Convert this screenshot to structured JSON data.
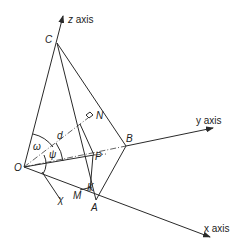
{
  "diagram": {
    "type": "3d-geometry-tetrahedron",
    "axes": {
      "z": {
        "label": "z axis"
      },
      "y": {
        "label": "y axis"
      },
      "x": {
        "label": "x axis"
      }
    },
    "points": {
      "O": "O",
      "A": "A",
      "B": "B",
      "C": "C",
      "N": "N",
      "P": "P",
      "K": "K",
      "M": "M"
    },
    "symbols": {
      "omega": "ω",
      "psi": "ψ",
      "chi": "χ",
      "d": "d"
    },
    "colors": {
      "line": "#2a2a2a",
      "background": "#ffffff"
    }
  }
}
